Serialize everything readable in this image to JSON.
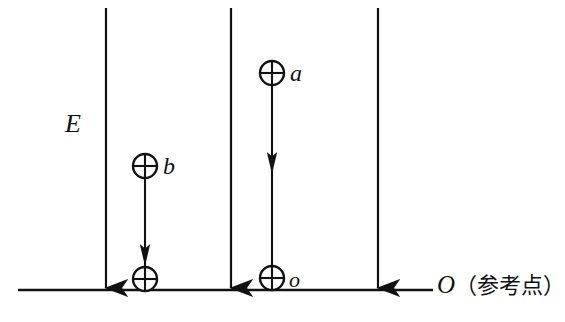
{
  "figure": {
    "type": "physics-diagram",
    "background_color": "#ffffff",
    "stroke_color": "#111111",
    "labels": {
      "field": "E",
      "particle_a": "a",
      "particle_b": "b",
      "particle_o": "o",
      "origin_letter": "O",
      "origin_note": "（参考点）"
    },
    "field_lines": [
      {
        "name": "field-line-1",
        "x": 106,
        "y_top": 8,
        "y_bottom": 290
      },
      {
        "name": "field-line-2",
        "x": 231,
        "y_top": 8,
        "y_bottom": 290
      },
      {
        "name": "field-line-3",
        "x": 378,
        "y_top": 8,
        "y_bottom": 290
      }
    ],
    "baseline": {
      "name": "reference-line",
      "x_start": 18,
      "x_end": 433,
      "y": 290
    },
    "particles": [
      {
        "name": "particle-a",
        "label": "a",
        "cx": 272,
        "cy": 73,
        "r": 12
      },
      {
        "name": "particle-b",
        "label": "b",
        "cx": 145,
        "cy": 166,
        "r": 12
      },
      {
        "name": "particle-o",
        "label": "o",
        "cx": 272,
        "cy": 278,
        "r": 12
      },
      {
        "name": "particle-landing",
        "label": "",
        "cx": 145,
        "cy": 279,
        "r": 12
      }
    ],
    "trajectories": [
      {
        "name": "trajectory-a",
        "x": 272,
        "y_top": 85,
        "y_bottom": 266,
        "arrow_y": 163
      },
      {
        "name": "trajectory-b",
        "x": 145,
        "y_top": 178,
        "y_bottom": 267,
        "arrow_y": 255
      }
    ]
  }
}
